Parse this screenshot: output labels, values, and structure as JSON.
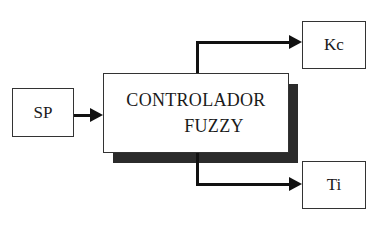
{
  "diagram": {
    "type": "block-diagram",
    "input": {
      "label": "SP"
    },
    "controller": {
      "line1": "CONTROLADOR",
      "line2": "FUZZY"
    },
    "outputs": [
      {
        "label": "Kc"
      },
      {
        "label": "Ti"
      }
    ],
    "edges": [
      {
        "from": "SP",
        "to": "CONTROLADOR FUZZY"
      },
      {
        "from": "CONTROLADOR FUZZY",
        "to": "Kc"
      },
      {
        "from": "CONTROLADOR FUZZY",
        "to": "Ti"
      }
    ]
  }
}
